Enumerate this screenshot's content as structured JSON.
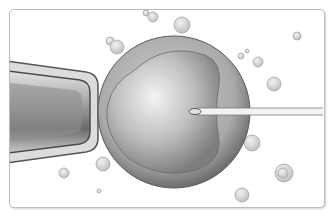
{
  "scene": {
    "title": "",
    "description": "Illustration of intracytoplasmic sperm injection: holding pipette on left, egg cell in center, injection needle from right, floating bubbles",
    "colors": {
      "background": "#ffffff",
      "frame_border": "#bdbdbd",
      "cell_outer": "#8a8a8a",
      "cell_inner": "#c8c8c8",
      "bubble": "#d6d6d6"
    }
  },
  "elements": {
    "holding_pipette": {
      "label": "holding-pipette"
    },
    "egg_cell": {
      "label": "egg-cell"
    },
    "injection_needle": {
      "label": "injection-needle"
    },
    "bubbles": [
      {
        "cx": 146,
        "cy": 13,
        "r": 3
      },
      {
        "cx": 153,
        "cy": 17,
        "r": 5
      },
      {
        "cx": 182,
        "cy": 25,
        "r": 8
      },
      {
        "cx": 110,
        "cy": 41,
        "r": 4
      },
      {
        "cx": 117,
        "cy": 47,
        "r": 7
      },
      {
        "cx": 241,
        "cy": 56,
        "r": 3
      },
      {
        "cx": 247,
        "cy": 51,
        "r": 2
      },
      {
        "cx": 258,
        "cy": 62,
        "r": 5
      },
      {
        "cx": 297,
        "cy": 36,
        "r": 4
      },
      {
        "cx": 274,
        "cy": 84,
        "r": 7
      },
      {
        "cx": 252,
        "cy": 143,
        "r": 8
      },
      {
        "cx": 103,
        "cy": 164,
        "r": 7
      },
      {
        "cx": 64,
        "cy": 173,
        "r": 5
      },
      {
        "cx": 284,
        "cy": 173,
        "r": 9
      },
      {
        "cx": 283,
        "cy": 173,
        "r": 5
      },
      {
        "cx": 99,
        "cy": 191,
        "r": 2
      },
      {
        "cx": 242,
        "cy": 195,
        "r": 7
      }
    ]
  }
}
